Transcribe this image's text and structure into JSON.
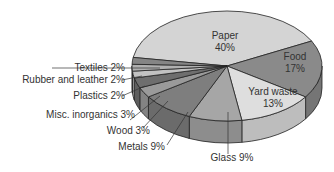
{
  "chart_data": {
    "type": "pie",
    "style": "3d",
    "title": "",
    "categories": [
      "Paper",
      "Food",
      "Yard waste",
      "Glass",
      "Metals",
      "Wood",
      "Misc. inorganics",
      "Plastics",
      "Rubber and leather",
      "Textiles"
    ],
    "values": [
      40,
      17,
      13,
      9,
      9,
      3,
      3,
      2,
      2,
      2
    ],
    "unit": "%",
    "labels": [
      {
        "name": "Paper",
        "value": "40%",
        "placement": "inside"
      },
      {
        "name": "Food",
        "value": "17%",
        "placement": "inside"
      },
      {
        "name": "Yard waste",
        "value": "13%",
        "placement": "inside"
      },
      {
        "name": "Glass",
        "value": "9%",
        "placement": "outside"
      },
      {
        "name": "Metals",
        "value": "9%",
        "placement": "outside"
      },
      {
        "name": "Wood",
        "value": "3%",
        "placement": "outside"
      },
      {
        "name": "Misc. inorganics",
        "value": "3%",
        "placement": "outside"
      },
      {
        "name": "Plastics",
        "value": "2%",
        "placement": "outside"
      },
      {
        "name": "Rubber and leather",
        "value": "2%",
        "placement": "outside"
      },
      {
        "name": "Textiles",
        "value": "2%",
        "placement": "outside"
      }
    ],
    "colors": [
      "#d4d4d4",
      "#8a8a8a",
      "#dedede",
      "#a6a6a6",
      "#7e7e7e",
      "#9a9a9a",
      "#6e6e6e",
      "#c2c2c2",
      "#b0b0b0",
      "#858585"
    ],
    "legend": "none"
  },
  "labels": {
    "paper_name": "Paper",
    "paper_value": "40%",
    "food_name": "Food",
    "food_value": "17%",
    "yard_name": "Yard waste",
    "yard_value": "13%",
    "glass": "Glass  9%",
    "metals": "Metals  9%",
    "wood": "Wood  3%",
    "misc": "Misc. inorganics  3%",
    "plastics": "Plastics  2%",
    "rubber": "Rubber and leather  2%",
    "textiles": "Textiles  2%"
  }
}
